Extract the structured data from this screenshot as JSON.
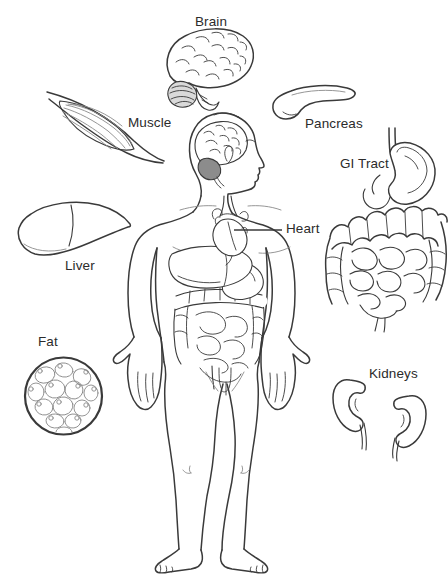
{
  "figure": {
    "labels": {
      "brain": "Brain",
      "muscle": "Muscle",
      "pancreas": "Pancreas",
      "gi_tract": "GI Tract",
      "heart": "Heart",
      "liver": "Liver",
      "fat": "Fat",
      "kidneys": "Kidneys"
    },
    "colors": {
      "line": "#3a3a3a",
      "line_light": "#8a8a8a",
      "text": "#2b2b2b",
      "background": "#ffffff",
      "shading": "#8c8c8c"
    }
  }
}
